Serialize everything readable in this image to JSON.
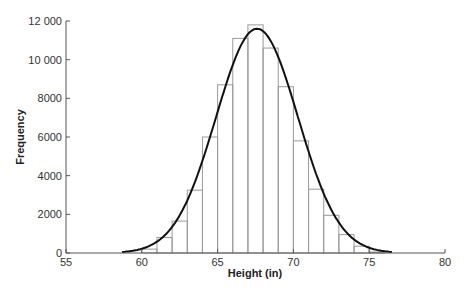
{
  "chart_data": {
    "type": "bar",
    "title": "",
    "xlabel": "Height (in)",
    "ylabel": "Frequency",
    "xlim": [
      55,
      80
    ],
    "ylim": [
      0,
      12000
    ],
    "x_ticks": [
      55,
      60,
      65,
      70,
      75,
      80
    ],
    "x_tick_labels": [
      "55",
      "60",
      "65",
      "70",
      "75",
      "80"
    ],
    "y_ticks": [
      0,
      2000,
      4000,
      6000,
      8000,
      10000,
      12000
    ],
    "y_tick_labels": [
      "0",
      "2000",
      "4000",
      "6000",
      "8000",
      "10 000",
      "12 000"
    ],
    "grid": false,
    "legend": null,
    "bin_width": 1,
    "categories": [
      "60-61",
      "61-62",
      "62-63",
      "63-64",
      "64-65",
      "65-66",
      "66-67",
      "67-68",
      "68-69",
      "69-70",
      "70-71",
      "71-72",
      "72-73",
      "73-74",
      "74-75",
      "75-76"
    ],
    "bin_edges_start": [
      60,
      61,
      62,
      63,
      64,
      65,
      66,
      67,
      68,
      69,
      70,
      71,
      72,
      73,
      74,
      75
    ],
    "values": [
      200,
      800,
      1650,
      3250,
      6000,
      8700,
      11100,
      11800,
      10600,
      8600,
      5800,
      3300,
      1950,
      950,
      350,
      50
    ],
    "overlay": {
      "type": "line",
      "name": "Normal curve fit",
      "mean": 67.6,
      "sd": 2.7,
      "peak": 11600,
      "x_range": [
        58.7,
        76.5
      ]
    }
  }
}
